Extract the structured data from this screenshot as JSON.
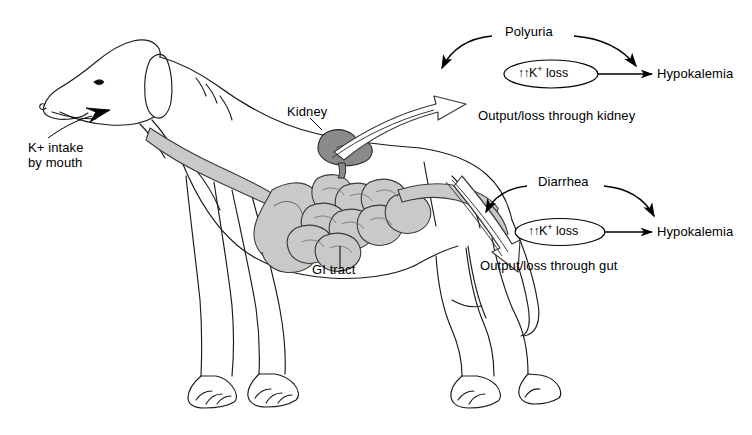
{
  "labels": {
    "k_intake_line1": "K+ intake",
    "k_intake_line2": "by mouth",
    "kidney": "Kidney",
    "gi_tract": "GI tract",
    "output_kidney": "Output/loss through kidney",
    "output_gut": "Output/loss through gut",
    "polyuria": "Polyuria",
    "diarrhea": "Diarrhea",
    "hypokalemia_kidney": "Hypokalemia",
    "hypokalemia_gut": "Hypokalemia",
    "k_loss_arrows": "↑↑",
    "k_loss_text": "K",
    "k_loss_sup": "+",
    "k_loss_suffix": " loss"
  },
  "colors": {
    "ink": "#000000",
    "background": "#ffffff",
    "kidney_fill": "#8a8a8a",
    "gi_fill": "#c9c9c9",
    "gi_fill_light": "#d6d6d6",
    "outline": "#1a1a1a"
  },
  "pathways": [
    {
      "id": "renal",
      "organ": "Kidney",
      "output": "Output/loss through kidney",
      "cause": "Polyuria",
      "mediator": "↑↑ K+ loss",
      "outcome": "Hypokalemia"
    },
    {
      "id": "gastrointestinal",
      "organ": "GI tract",
      "output": "Output/loss through gut",
      "cause": "Diarrhea",
      "mediator": "↑↑ K+ loss",
      "outcome": "Hypokalemia"
    }
  ],
  "input": {
    "route": "K+ intake by mouth"
  }
}
